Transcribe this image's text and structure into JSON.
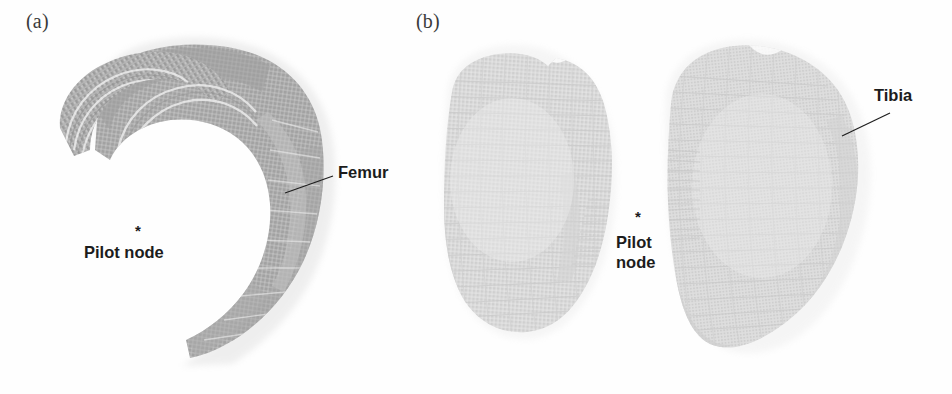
{
  "figure": {
    "kind": "finite-element-bone-mesh-figure",
    "background_color": "#fefefe",
    "width": 952,
    "height": 394
  },
  "panels": [
    {
      "id": "a",
      "label": "(a)",
      "subject": "Femur",
      "mesh_color": "#b2b2b2",
      "mesh_color_dark": "#9a9a9a",
      "mesh_color_light": "#c8c8c8",
      "annotations": [
        {
          "name": "femur-label",
          "text": "Femur",
          "x": 338,
          "y": 172
        },
        {
          "name": "pilot-node-label",
          "text": "Pilot node",
          "x": 84,
          "y": 252
        }
      ],
      "markers": [
        {
          "name": "pilot-node-asterisk",
          "text": "*",
          "x": 135,
          "y": 232,
          "size": 15
        }
      ]
    },
    {
      "id": "b",
      "label": "(b)",
      "subject": "Tibia",
      "mesh_color": "#dcdcdc",
      "mesh_color_dark": "#cdcdcd",
      "mesh_color_light": "#e8e8e8",
      "annotations": [
        {
          "name": "tibia-label",
          "text": "Tibia",
          "x": 874,
          "y": 95
        },
        {
          "name": "pilot-node-line-1",
          "text": "Pilot",
          "x": 616,
          "y": 242
        },
        {
          "name": "pilot-node-line-2",
          "text": "node",
          "x": 616,
          "y": 262
        }
      ],
      "markers": [
        {
          "name": "pilot-node-asterisk",
          "text": "*",
          "x": 635,
          "y": 218,
          "size": 15
        }
      ]
    }
  ],
  "leader_lines": [
    {
      "name": "femur-leader-line",
      "x1": 285,
      "y1": 193,
      "x2": 333,
      "y2": 176
    },
    {
      "name": "tibia-leader-line",
      "x1": 842,
      "y1": 136,
      "x2": 890,
      "y2": 113
    }
  ],
  "colors": {
    "annotation_text": "#1c1c1c",
    "panel_label_text": "#3a3a3a",
    "leader_line": "#1e1e1e",
    "background": "#fefefe"
  }
}
